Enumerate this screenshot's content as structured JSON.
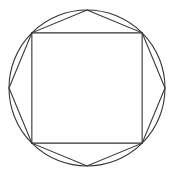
{
  "figure": {
    "shapes": [
      {
        "name": "circumscribed-circle",
        "type": "circle"
      },
      {
        "name": "inscribed-square",
        "type": "polygon",
        "sides": 4
      },
      {
        "name": "inscribed-octagon",
        "type": "polygon",
        "sides": 8
      }
    ],
    "line_color": "#333333",
    "background": "#ffffff"
  }
}
